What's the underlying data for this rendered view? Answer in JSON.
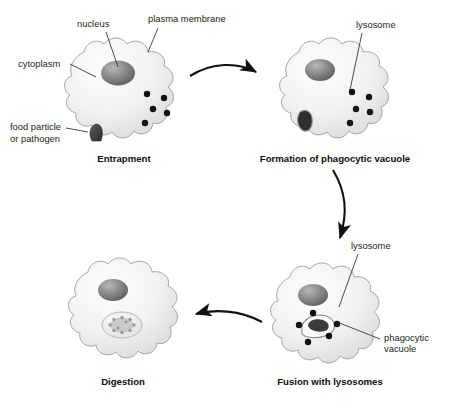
{
  "diagram": {
    "background_color": "#ffffff",
    "outline_color": "#9a9a9a",
    "lysosome_color": "#121212",
    "text_color": "#231f20",
    "caption_color": "#0d0d0d",
    "particle_color": "#3d3d3d"
  },
  "stages": [
    {
      "id": "entrapment",
      "caption": "Entrapment",
      "caption_x": 124,
      "caption_y": 162,
      "cell_cx": 118,
      "cell_cy": 88,
      "lysosome_count": 5,
      "has_food_particle": true,
      "has_vacuole": false
    },
    {
      "id": "formation-of-phagocytic-vacuole",
      "caption": "Formation of phagocytic vacuole",
      "caption_x": 335,
      "caption_y": 162,
      "cell_cx": 333,
      "cell_cy": 88,
      "lysosome_count": 5,
      "has_food_particle": false,
      "has_vacuole": true
    },
    {
      "id": "fusion-with-lysosomes",
      "caption": "Fusion with lysosomes",
      "caption_x": 330,
      "caption_y": 385,
      "cell_cx": 322,
      "cell_cy": 310,
      "lysosome_count": 5,
      "has_food_particle": false,
      "has_vacuole": true
    },
    {
      "id": "digestion",
      "caption": "Digestion",
      "caption_x": 123,
      "caption_y": 385,
      "cell_cx": 118,
      "cell_cy": 310,
      "lysosome_count": 0,
      "has_food_particle": false,
      "has_vacuole": true
    }
  ],
  "annotations": [
    {
      "id": "cytoplasm",
      "label": "cytoplasm",
      "text_x": 18,
      "text_y": 67,
      "anchor": "start",
      "line": "M 70,64 L 96,77"
    },
    {
      "id": "nucleus",
      "label": "nucleus",
      "text_x": 77,
      "text_y": 27,
      "anchor": "start",
      "line": "M 106,32 L 118,67"
    },
    {
      "id": "plasma-membrane",
      "label": "plasma membrane",
      "text_x": 148,
      "text_y": 22,
      "anchor": "start",
      "line": "M 158,28 L 148,52"
    },
    {
      "id": "food-particle",
      "label": "food particle",
      "text_x": 10,
      "text_y": 130,
      "anchor": "start",
      "line": "M 66,128 L 87,131"
    },
    {
      "id": "food-particle-line2",
      "label": "or pathogen",
      "text_x": 10,
      "text_y": 142,
      "anchor": "start",
      "line": ""
    },
    {
      "id": "lysosome-top",
      "label": "lysosome",
      "text_x": 356,
      "text_y": 28,
      "anchor": "start",
      "line": "M 362,33 L 350,90"
    },
    {
      "id": "lysosome-bottom",
      "label": "lysosome",
      "text_x": 351,
      "text_y": 249,
      "anchor": "start",
      "line": "M 358,254 L 339,307"
    },
    {
      "id": "phagocytic-vacuole",
      "label": "phagocytic",
      "text_x": 384,
      "text_y": 341,
      "anchor": "start",
      "line": "M 380,339 L 337,322"
    },
    {
      "id": "phagocytic-vacuole-line2",
      "label": "vacuole",
      "text_x": 384,
      "text_y": 352,
      "anchor": "start",
      "line": ""
    }
  ],
  "arrows": [
    {
      "id": "arrow-entrapment-to-formation",
      "from_stage": "entrapment",
      "to_stage": "formation-of-phagocytic-vacuole",
      "direction": "right"
    },
    {
      "id": "arrow-formation-to-fusion",
      "from_stage": "formation-of-phagocytic-vacuole",
      "to_stage": "fusion-with-lysosomes",
      "direction": "down"
    },
    {
      "id": "arrow-fusion-to-digestion",
      "from_stage": "fusion-with-lysosomes",
      "to_stage": "digestion",
      "direction": "left"
    }
  ]
}
